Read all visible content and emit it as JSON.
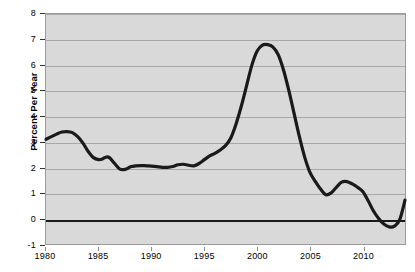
{
  "chart_data": {
    "type": "line",
    "title": "",
    "xlabel": "",
    "ylabel": "Percent Per Year",
    "xlim": [
      1980,
      2014
    ],
    "ylim": [
      -1,
      8
    ],
    "grid": true,
    "legend": false,
    "colors": {
      "plot_background": "#d9d9d9",
      "page_background": "#ffffff",
      "gridline": "#a8a8a8",
      "zero_line": "#1a1a1a",
      "series_line": "#1a1a1a",
      "axis_text": "#000000"
    },
    "y_ticks": [
      -1,
      0,
      1,
      2,
      3,
      4,
      5,
      6,
      7,
      8
    ],
    "y_tick_labels": [
      "-1",
      "0",
      "1",
      "2",
      "3",
      "4",
      "5",
      "6",
      "7",
      "8"
    ],
    "x_ticks": [
      1980,
      1985,
      1990,
      1995,
      2000,
      2005,
      2010
    ],
    "x_tick_labels": [
      "1980",
      "1985",
      "1990",
      "1995",
      "2000",
      "2005",
      "2010"
    ],
    "series": [
      {
        "name": "Percent Per Year",
        "x": [
          1980,
          1980.5,
          1981,
          1981.5,
          1982,
          1982.5,
          1983,
          1983.5,
          1984,
          1984.5,
          1985,
          1985.3,
          1985.7,
          1986,
          1986.5,
          1987,
          1987.5,
          1988,
          1988.5,
          1989,
          1989.5,
          1990,
          1990.5,
          1991,
          1991.5,
          1992,
          1992.5,
          1993,
          1993.5,
          1994,
          1994.5,
          1995,
          1995.5,
          1996,
          1996.5,
          1997,
          1997.5,
          1998,
          1998.5,
          1999,
          1999.5,
          2000,
          2000.5,
          2001,
          2001.5,
          2002,
          2002.5,
          2003,
          2003.5,
          2004,
          2004.5,
          2005,
          2005.5,
          2006,
          2006.5,
          2007,
          2007.5,
          2008,
          2008.5,
          2009,
          2009.5,
          2010,
          2010.5,
          2011,
          2011.5,
          2012,
          2012.5,
          2013,
          2013.5,
          2014
        ],
        "y": [
          3.1,
          3.2,
          3.3,
          3.38,
          3.4,
          3.36,
          3.2,
          2.95,
          2.62,
          2.38,
          2.3,
          2.32,
          2.4,
          2.38,
          2.15,
          1.93,
          1.92,
          2.02,
          2.06,
          2.07,
          2.06,
          2.05,
          2.03,
          2.0,
          2.0,
          2.03,
          2.1,
          2.12,
          2.08,
          2.06,
          2.15,
          2.3,
          2.45,
          2.55,
          2.68,
          2.85,
          3.15,
          3.7,
          4.4,
          5.2,
          6.0,
          6.55,
          6.78,
          6.8,
          6.7,
          6.4,
          5.8,
          5.0,
          4.1,
          3.2,
          2.4,
          1.8,
          1.45,
          1.15,
          0.93,
          1.0,
          1.22,
          1.42,
          1.44,
          1.35,
          1.22,
          1.05,
          0.7,
          0.3,
          0.0,
          -0.22,
          -0.33,
          -0.3,
          -0.05,
          0.72
        ]
      }
    ],
    "annotations": []
  }
}
